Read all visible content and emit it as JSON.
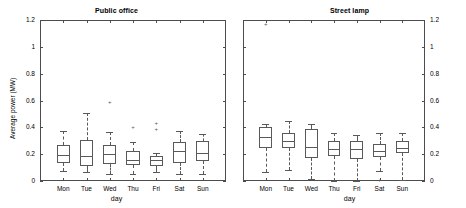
{
  "figure": {
    "background": "#ffffff",
    "line_color": "#595959",
    "axis_color": "#4d4d4d"
  },
  "chart_data": [
    {
      "type": "box",
      "panel": "left",
      "title": "Public office",
      "xlabel": "day",
      "ylabel": "Average power (MW)",
      "ylim": [
        0,
        1.2
      ],
      "yticks": [
        0,
        0.2,
        0.4,
        0.6,
        0.8,
        1,
        1.2
      ],
      "ytick_labels": [
        "0",
        "0.2",
        "0.4",
        "0.6",
        "0.8",
        "1",
        "1.2"
      ],
      "ytick_side": "left",
      "grid": false,
      "categories": [
        "Mon",
        "Tue",
        "Wed",
        "Thu",
        "Fri",
        "Sat",
        "Sun"
      ],
      "boxes": [
        {
          "category": "Mon",
          "whisker_low": 0.075,
          "q1": 0.135,
          "median": 0.195,
          "q3": 0.265,
          "whisker_high": 0.375,
          "outliers": []
        },
        {
          "category": "Tue",
          "whisker_low": 0.065,
          "q1": 0.11,
          "median": 0.19,
          "q3": 0.305,
          "whisker_high": 0.51,
          "outliers": []
        },
        {
          "category": "Wed",
          "whisker_low": 0.055,
          "q1": 0.13,
          "median": 0.2,
          "q3": 0.265,
          "whisker_high": 0.365,
          "outliers": [
            0.59
          ]
        },
        {
          "category": "Thu",
          "whisker_low": 0.055,
          "q1": 0.12,
          "median": 0.16,
          "q3": 0.225,
          "whisker_high": 0.29,
          "outliers": [
            0.405
          ]
        },
        {
          "category": "Fri",
          "whisker_low": 0.07,
          "q1": 0.115,
          "median": 0.155,
          "q3": 0.185,
          "whisker_high": 0.205,
          "outliers": [
            0.39,
            0.435
          ]
        },
        {
          "category": "Sat",
          "whisker_low": 0.055,
          "q1": 0.135,
          "median": 0.22,
          "q3": 0.29,
          "whisker_high": 0.37,
          "outliers": []
        },
        {
          "category": "Sun",
          "whisker_low": 0.055,
          "q1": 0.15,
          "median": 0.21,
          "q3": 0.295,
          "whisker_high": 0.35,
          "outliers": []
        }
      ]
    },
    {
      "type": "box",
      "panel": "right",
      "title": "Street lamp",
      "xlabel": "day",
      "ylabel": "",
      "ylim": [
        0,
        1.2
      ],
      "yticks": [
        0,
        0.2,
        0.4,
        0.6,
        0.8,
        1,
        1.2
      ],
      "ytick_labels": [
        "0",
        "0.2",
        "0.4",
        "0.6",
        "0.8",
        "1",
        "1.2"
      ],
      "ytick_side": "right",
      "grid": false,
      "categories": [
        "Mon",
        "Tue",
        "Wed",
        "Thu",
        "Fri",
        "Sat",
        "Sun"
      ],
      "boxes": [
        {
          "category": "Mon",
          "whisker_low": 0.065,
          "q1": 0.245,
          "median": 0.33,
          "q3": 0.405,
          "whisker_high": 0.425,
          "outliers": [
            1.17
          ]
        },
        {
          "category": "Tue",
          "whisker_low": 0.085,
          "q1": 0.245,
          "median": 0.295,
          "q3": 0.36,
          "whisker_high": 0.45,
          "outliers": []
        },
        {
          "category": "Wed",
          "whisker_low": 0.015,
          "q1": 0.17,
          "median": 0.25,
          "q3": 0.385,
          "whisker_high": 0.425,
          "outliers": []
        },
        {
          "category": "Thu",
          "whisker_low": 0.0,
          "q1": 0.185,
          "median": 0.24,
          "q3": 0.3,
          "whisker_high": 0.355,
          "outliers": []
        },
        {
          "category": "Fri",
          "whisker_low": 0.0,
          "q1": 0.165,
          "median": 0.235,
          "q3": 0.3,
          "whisker_high": 0.345,
          "outliers": []
        },
        {
          "category": "Sat",
          "whisker_low": 0.075,
          "q1": 0.18,
          "median": 0.225,
          "q3": 0.275,
          "whisker_high": 0.355,
          "outliers": [
            0.005
          ]
        },
        {
          "category": "Sun",
          "whisker_low": 0.01,
          "q1": 0.205,
          "median": 0.245,
          "q3": 0.3,
          "whisker_high": 0.36,
          "outliers": []
        }
      ]
    }
  ]
}
